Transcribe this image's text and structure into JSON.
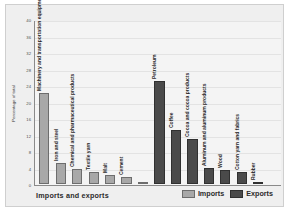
{
  "chart_data": {
    "type": "bar",
    "title": "",
    "xlabel": "Imports and exports",
    "ylabel": "Percentage of total",
    "ylim": [
      0,
      40
    ],
    "yticks": [
      0,
      4,
      8,
      12,
      16,
      20,
      24,
      28,
      32,
      36,
      40
    ],
    "grid": true,
    "legend_position": "bottom-right",
    "categories": [
      "Machinery and transportation equipment",
      "Iron and steel",
      "Chemical and pharmaceutical products",
      "Textile yarn",
      "Malt",
      "Cement",
      "",
      "Petroleum",
      "Coffee",
      "Cocoa and cocoa products",
      "Aluminum and aluminum products",
      "Wood",
      "Cotton yarn and fabrics",
      "Rubber",
      ""
    ],
    "series": [
      {
        "name": "Imports",
        "color": "#a8a8a8",
        "values": [
          22.0,
          5.0,
          3.6,
          3.0,
          2.3,
          1.7,
          0.3,
          null,
          null,
          null,
          null,
          null,
          null,
          null,
          null
        ]
      },
      {
        "name": "Exports",
        "color": "#4a4a4a",
        "values": [
          null,
          null,
          null,
          null,
          null,
          null,
          null,
          25.0,
          13.0,
          11.0,
          4.0,
          3.4,
          3.0,
          0.5,
          null
        ]
      }
    ],
    "bars": [
      {
        "label": "Machinery and transportation equipment",
        "value": 22.0,
        "series": "Imports"
      },
      {
        "label": "Iron and steel",
        "value": 5.0,
        "series": "Imports"
      },
      {
        "label": "Chemical and pharmaceutical products",
        "value": 3.6,
        "series": "Imports"
      },
      {
        "label": "Textile yarn",
        "value": 3.0,
        "series": "Imports"
      },
      {
        "label": "Malt",
        "value": 2.3,
        "series": "Imports"
      },
      {
        "label": "Cement",
        "value": 1.7,
        "series": "Imports"
      },
      {
        "label": "",
        "value": 0.3,
        "series": "Imports"
      },
      {
        "label": "Petroleum",
        "value": 25.0,
        "series": "Exports"
      },
      {
        "label": "Coffee",
        "value": 13.0,
        "series": "Exports"
      },
      {
        "label": "Cocoa and cocoa products",
        "value": 11.0,
        "series": "Exports"
      },
      {
        "label": "Aluminum and aluminum products",
        "value": 4.0,
        "series": "Exports"
      },
      {
        "label": "Wood",
        "value": 3.4,
        "series": "Exports"
      },
      {
        "label": "Cotton yarn and fabrics",
        "value": 3.0,
        "series": "Exports"
      },
      {
        "label": "Rubber",
        "value": 0.5,
        "series": "Exports"
      }
    ]
  },
  "legend": {
    "items": [
      {
        "label": "Imports",
        "color": "#a8a8a8"
      },
      {
        "label": "Exports",
        "color": "#4a4a4a"
      }
    ]
  },
  "colors": {
    "imports": "#a8a8a8",
    "exports": "#4a4a4a",
    "plate_background": "#efefef",
    "plot_background": "#f4f4f4",
    "axis": "#8a8a8a",
    "gridline": "#e3e3e3"
  }
}
